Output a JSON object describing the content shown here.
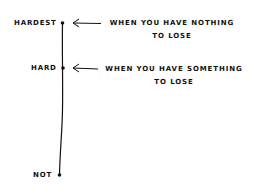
{
  "diagram": {
    "axis_labels": {
      "top": "HARDEST",
      "middle": "HARD",
      "bottom": "NOT"
    },
    "annotations": [
      {
        "target": "HARDEST",
        "text_line1": "WHEN YOU HAVE NOTHING",
        "text_line2": "TO LOSE"
      },
      {
        "target": "HARD",
        "text_line1": "WHEN YOU HAVE SOMETHING",
        "text_line2": "TO LOSE"
      }
    ]
  }
}
